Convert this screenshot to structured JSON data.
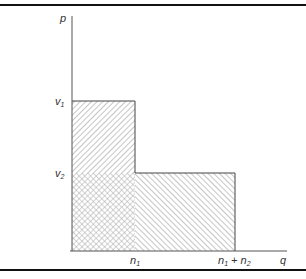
{
  "diagram": {
    "type": "step-function area diagram",
    "axes": {
      "y_label": "p",
      "x_label": "q"
    },
    "y_ticks": [
      {
        "label": "v",
        "sub": "1"
      },
      {
        "label": "v",
        "sub": "2"
      }
    ],
    "x_ticks": [
      {
        "label": "n",
        "sub": "1"
      },
      {
        "label": "n",
        "sub": "1",
        "plus": " + ",
        "label2": "n",
        "sub2": "2"
      }
    ],
    "regions": [
      {
        "name": "upper-left block (v1 - v2 over 0..n1)",
        "pattern": "forward-diagonal hatch"
      },
      {
        "name": "lower-left block (0..v2 over 0..n1)",
        "pattern": "cross hatch"
      },
      {
        "name": "lower-right block (0..v2 over n1..n1+n2)",
        "pattern": "backward-diagonal hatch"
      }
    ],
    "colors": {
      "line": "#333333",
      "hatch": "#9a9a9a",
      "frame_rule": "#111111"
    }
  }
}
